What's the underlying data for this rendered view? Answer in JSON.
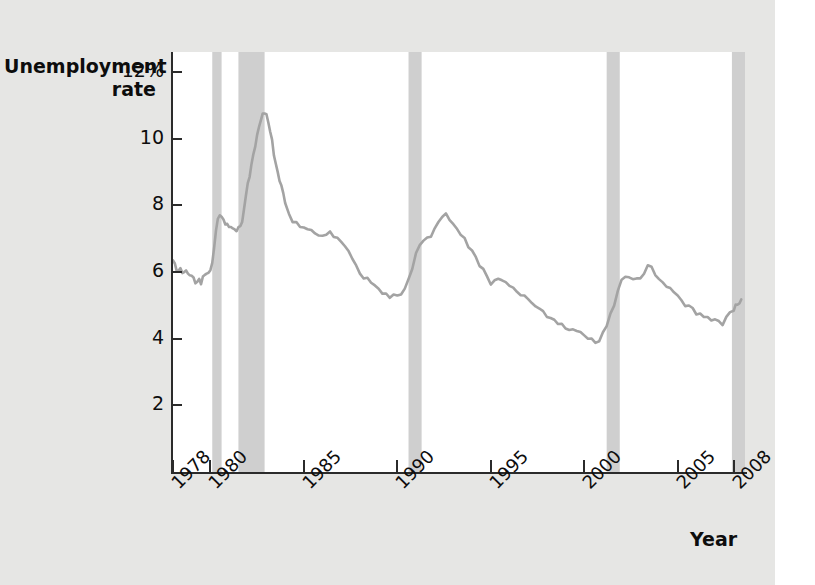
{
  "chart_data": {
    "type": "line",
    "title": "",
    "xlabel": "Year",
    "ylabel": "Unemployment rate",
    "xlim": [
      1978,
      2008.6
    ],
    "ylim": [
      0,
      12.6
    ],
    "grid": false,
    "legend": "none",
    "y_ticks": [
      {
        "value": 12,
        "label": "12%"
      },
      {
        "value": 10,
        "label": "10"
      },
      {
        "value": 8,
        "label": "8"
      },
      {
        "value": 6,
        "label": "6"
      },
      {
        "value": 4,
        "label": "4"
      },
      {
        "value": 2,
        "label": "2"
      }
    ],
    "x_ticks": [
      {
        "value": 1978,
        "label": "1978"
      },
      {
        "value": 1980,
        "label": "1980"
      },
      {
        "value": 1985,
        "label": "1985"
      },
      {
        "value": 1990,
        "label": "1990"
      },
      {
        "value": 1995,
        "label": "1995"
      },
      {
        "value": 2000,
        "label": "2000"
      },
      {
        "value": 2005,
        "label": "2005"
      },
      {
        "value": 2008,
        "label": "2008"
      }
    ],
    "series": [
      {
        "name": "Unemployment rate",
        "color": "#a3a3a3",
        "x": [
          1978.0,
          1978.1,
          1978.2,
          1978.3,
          1978.4,
          1978.5,
          1978.6,
          1978.7,
          1978.8,
          1978.9,
          1979.0,
          1979.1,
          1979.2,
          1979.3,
          1979.4,
          1979.5,
          1979.6,
          1979.7,
          1979.8,
          1979.9,
          1980.0,
          1980.1,
          1980.2,
          1980.3,
          1980.4,
          1980.5,
          1980.6,
          1980.7,
          1980.8,
          1980.9,
          1981.0,
          1981.1,
          1981.2,
          1981.3,
          1981.4,
          1981.5,
          1981.6,
          1981.7,
          1981.8,
          1981.9,
          1982.0,
          1982.1,
          1982.2,
          1982.3,
          1982.4,
          1982.5,
          1982.6,
          1982.7,
          1982.8,
          1982.9,
          1983.0,
          1983.1,
          1983.2,
          1983.3,
          1983.4,
          1983.5,
          1983.6,
          1983.7,
          1983.8,
          1983.9,
          1984.0,
          1984.2,
          1984.4,
          1984.6,
          1984.8,
          1985.0,
          1985.2,
          1985.4,
          1985.6,
          1985.8,
          1986.0,
          1986.2,
          1986.4,
          1986.6,
          1986.8,
          1987.0,
          1987.2,
          1987.4,
          1987.6,
          1987.8,
          1988.0,
          1988.2,
          1988.4,
          1988.6,
          1988.8,
          1989.0,
          1989.2,
          1989.4,
          1989.6,
          1989.8,
          1990.0,
          1990.2,
          1990.4,
          1990.6,
          1990.8,
          1991.0,
          1991.2,
          1991.4,
          1991.6,
          1991.8,
          1992.0,
          1992.2,
          1992.4,
          1992.6,
          1992.8,
          1993.0,
          1993.2,
          1993.4,
          1993.6,
          1993.8,
          1994.0,
          1994.2,
          1994.4,
          1994.6,
          1994.8,
          1995.0,
          1995.2,
          1995.4,
          1995.6,
          1995.8,
          1996.0,
          1996.2,
          1996.4,
          1996.6,
          1996.8,
          1997.0,
          1997.2,
          1997.4,
          1997.6,
          1997.8,
          1998.0,
          1998.2,
          1998.4,
          1998.6,
          1998.8,
          1999.0,
          1999.2,
          1999.4,
          1999.6,
          1999.8,
          2000.0,
          2000.2,
          2000.4,
          2000.6,
          2000.8,
          2001.0,
          2001.2,
          2001.4,
          2001.6,
          2001.8,
          2002.0,
          2002.2,
          2002.4,
          2002.6,
          2002.8,
          2003.0,
          2003.2,
          2003.4,
          2003.6,
          2003.8,
          2004.0,
          2004.2,
          2004.4,
          2004.6,
          2004.8,
          2005.0,
          2005.2,
          2005.4,
          2005.6,
          2005.8,
          2006.0,
          2006.2,
          2006.4,
          2006.6,
          2006.8,
          2007.0,
          2007.2,
          2007.4,
          2007.6,
          2007.8,
          2008.0,
          2008.1,
          2008.2,
          2008.3,
          2008.4
        ],
        "y": [
          6.35,
          6.25,
          6.1,
          6.05,
          6.15,
          6.0,
          5.95,
          6.05,
          5.9,
          5.85,
          5.9,
          5.8,
          5.7,
          5.75,
          5.8,
          5.7,
          5.85,
          5.9,
          5.95,
          5.9,
          6.05,
          6.25,
          6.7,
          7.3,
          7.6,
          7.75,
          7.7,
          7.55,
          7.45,
          7.4,
          7.3,
          7.35,
          7.25,
          7.3,
          7.25,
          7.35,
          7.45,
          7.5,
          7.9,
          8.3,
          8.6,
          8.85,
          9.2,
          9.5,
          9.8,
          10.1,
          10.4,
          10.6,
          10.75,
          10.8,
          10.7,
          10.45,
          10.2,
          9.9,
          9.5,
          9.25,
          9.0,
          8.8,
          8.6,
          8.4,
          8.1,
          7.7,
          7.5,
          7.45,
          7.3,
          7.35,
          7.25,
          7.3,
          7.2,
          7.1,
          7.15,
          7.1,
          7.2,
          7.05,
          6.95,
          6.9,
          6.75,
          6.6,
          6.45,
          6.2,
          6.0,
          5.85,
          5.8,
          5.7,
          5.55,
          5.45,
          5.35,
          5.3,
          5.25,
          5.35,
          5.3,
          5.4,
          5.5,
          5.8,
          6.1,
          6.5,
          6.8,
          6.9,
          7.0,
          7.1,
          7.3,
          7.55,
          7.7,
          7.75,
          7.6,
          7.4,
          7.25,
          7.1,
          6.95,
          6.75,
          6.65,
          6.45,
          6.25,
          6.1,
          5.9,
          5.65,
          5.7,
          5.8,
          5.7,
          5.65,
          5.6,
          5.5,
          5.45,
          5.35,
          5.3,
          5.25,
          5.05,
          4.95,
          4.9,
          4.75,
          4.65,
          4.6,
          4.55,
          4.5,
          4.45,
          4.35,
          4.3,
          4.25,
          4.25,
          4.15,
          4.05,
          4.0,
          3.95,
          3.9,
          3.95,
          4.2,
          4.45,
          4.75,
          5.0,
          5.45,
          5.7,
          5.85,
          5.8,
          5.75,
          5.85,
          5.8,
          6.0,
          6.25,
          6.15,
          5.95,
          5.75,
          5.65,
          5.55,
          5.45,
          5.4,
          5.3,
          5.15,
          5.05,
          5.0,
          4.95,
          4.75,
          4.7,
          4.65,
          4.6,
          4.5,
          4.6,
          4.5,
          4.45,
          4.7,
          4.8,
          4.9,
          5.0,
          5.0,
          5.05,
          5.1
        ]
      }
    ],
    "recession_bands": {
      "color": "#cfcfcf",
      "label": "recession",
      "spans": [
        {
          "start": 1980.1,
          "end": 1980.6
        },
        {
          "start": 1981.5,
          "end": 1982.9
        },
        {
          "start": 1990.6,
          "end": 1991.3
        },
        {
          "start": 2001.2,
          "end": 2001.9
        },
        {
          "start": 2007.9,
          "end": 2008.6
        }
      ]
    }
  },
  "axis_titles": {
    "y_line1": "Unemployment",
    "y_line2": "rate",
    "x": "Year"
  }
}
